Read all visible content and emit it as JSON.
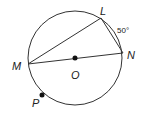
{
  "diagram": {
    "type": "circle-geometry",
    "circle": {
      "center_label": "O",
      "cx": 75,
      "cy": 58,
      "r": 47
    },
    "points": [
      {
        "label": "L",
        "x": 101,
        "y": 18,
        "label_x": 100,
        "label_y": 15
      },
      {
        "label": "N",
        "x": 123,
        "y": 53,
        "label_x": 127,
        "label_y": 59
      },
      {
        "label": "M",
        "x": 28,
        "y": 64,
        "label_x": 12,
        "label_y": 70
      },
      {
        "label": "O",
        "x": 75,
        "y": 58,
        "label_x": 71,
        "label_y": 79
      },
      {
        "label": "P",
        "x": 42,
        "y": 95,
        "label_x": 32,
        "label_y": 107
      }
    ],
    "arc_annotation": {
      "text": "50°",
      "x": 117,
      "y": 33
    },
    "segments": [
      "ML",
      "LN",
      "MN"
    ],
    "colors": {
      "stroke": "#333333",
      "dot": "#111111",
      "text": "#222222"
    }
  }
}
